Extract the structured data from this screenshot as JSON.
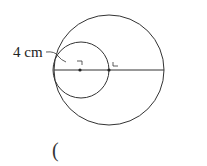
{
  "diagram": {
    "radius_label": "4 cm",
    "answer_paren": "(",
    "colors": {
      "stroke": "#333333",
      "background": "#ffffff"
    },
    "large_circle": {
      "cx": 109,
      "cy": 70,
      "r": 55
    },
    "small_circle": {
      "cx": 81,
      "cy": 70,
      "r": 28
    },
    "diameter_line": {
      "x1": 54,
      "y1": 70,
      "x2": 164,
      "y2": 70
    },
    "points": [
      {
        "x": 80,
        "y": 70
      },
      {
        "x": 109,
        "y": 70
      }
    ]
  }
}
